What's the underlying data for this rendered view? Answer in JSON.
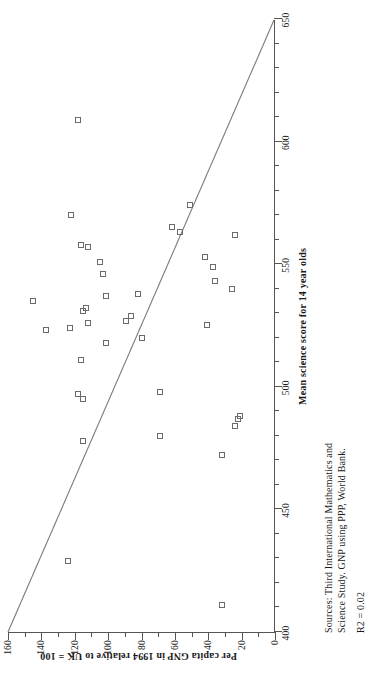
{
  "chart_data": {
    "type": "scatter",
    "title": "",
    "xlabel": "Mean science score for 14 year olds",
    "ylabel": "Per capita GNP in 1994 relative to UK = 100",
    "xlim": [
      400,
      650
    ],
    "ylim": [
      0,
      160
    ],
    "xticks": [
      400,
      450,
      500,
      550,
      600,
      650
    ],
    "yticks": [
      0,
      20,
      40,
      60,
      80,
      100,
      120,
      140,
      160
    ],
    "x_minor_step": 10,
    "y_minor_step": 10,
    "grid": false,
    "legend": "none",
    "marker": "open-square",
    "points": [
      {
        "x": 411,
        "y": 32
      },
      {
        "x": 429,
        "y": 124
      },
      {
        "x": 472,
        "y": 32
      },
      {
        "x": 478,
        "y": 115
      },
      {
        "x": 480,
        "y": 69
      },
      {
        "x": 484,
        "y": 24
      },
      {
        "x": 487,
        "y": 22
      },
      {
        "x": 488,
        "y": 21
      },
      {
        "x": 495,
        "y": 115
      },
      {
        "x": 497,
        "y": 118
      },
      {
        "x": 498,
        "y": 69
      },
      {
        "x": 511,
        "y": 116
      },
      {
        "x": 518,
        "y": 101
      },
      {
        "x": 520,
        "y": 80
      },
      {
        "x": 523,
        "y": 137
      },
      {
        "x": 524,
        "y": 123
      },
      {
        "x": 525,
        "y": 41
      },
      {
        "x": 526,
        "y": 112
      },
      {
        "x": 527,
        "y": 89
      },
      {
        "x": 529,
        "y": 86
      },
      {
        "x": 531,
        "y": 115
      },
      {
        "x": 532,
        "y": 113
      },
      {
        "x": 535,
        "y": 145
      },
      {
        "x": 537,
        "y": 101
      },
      {
        "x": 538,
        "y": 82
      },
      {
        "x": 540,
        "y": 26
      },
      {
        "x": 543,
        "y": 36
      },
      {
        "x": 546,
        "y": 103
      },
      {
        "x": 549,
        "y": 37
      },
      {
        "x": 551,
        "y": 105
      },
      {
        "x": 553,
        "y": 42
      },
      {
        "x": 557,
        "y": 112
      },
      {
        "x": 558,
        "y": 116
      },
      {
        "x": 562,
        "y": 24
      },
      {
        "x": 563,
        "y": 57
      },
      {
        "x": 565,
        "y": 62
      },
      {
        "x": 570,
        "y": 122
      },
      {
        "x": 574,
        "y": 51
      },
      {
        "x": 609,
        "y": 118
      }
    ],
    "trendline": {
      "visible": true,
      "from": {
        "x": 400,
        "y": 160
      },
      "to": {
        "x": 650,
        "y": 0
      },
      "r2": 0.02
    }
  },
  "axes": {
    "x_title": "Mean science score for 14 year olds",
    "y_title": "Per capita GNP in 1994 relative to UK = 100",
    "x_tick_labels": [
      "400",
      "450",
      "500",
      "550",
      "600",
      "650"
    ],
    "y_tick_labels": [
      "0",
      "20",
      "40",
      "60",
      "80",
      "100",
      "120",
      "140",
      "160"
    ]
  },
  "footnote": {
    "line1": "Sources: Third International Mathematics and",
    "line2": "Science Study. GNP using PPP, World Bank.",
    "r2": "R2 = 0.02"
  },
  "colors": {
    "marker_stroke": "#6b6b6b",
    "axis": "#555555",
    "trendline": "#7a7a7a",
    "text": "#1a1a1a",
    "background": "#ffffff"
  }
}
